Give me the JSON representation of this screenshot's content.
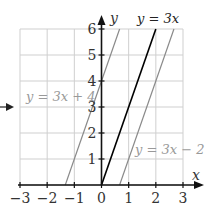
{
  "chart_data": {
    "type": "line",
    "title": "",
    "xlabel": "x",
    "ylabel": "y",
    "xlim": [
      -3,
      3
    ],
    "ylim": [
      0,
      6
    ],
    "x_ticks": [
      "-3",
      "-2",
      "-1",
      "0",
      "1",
      "2",
      "3"
    ],
    "y_ticks": [
      "1",
      "2",
      "3",
      "4",
      "5",
      "6"
    ],
    "grid": true,
    "series": [
      {
        "name": "y = 3x + 4",
        "slope": 3,
        "intercept": 4,
        "color": "#8a8a8a"
      },
      {
        "name": "y = 3x",
        "slope": 3,
        "intercept": 0,
        "color": "#000000"
      },
      {
        "name": "y = 3x − 2",
        "slope": 3,
        "intercept": -2,
        "color": "#8a8a8a"
      }
    ],
    "annotations": [
      {
        "type": "arrow",
        "points_to": "y = 3x + 4 label"
      }
    ]
  }
}
